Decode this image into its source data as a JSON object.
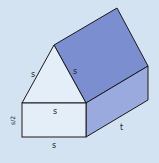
{
  "diagram": {
    "colors": {
      "background": "#d4e3f2",
      "front_face": "#e4eef8",
      "roof_face": "#7b8fd0",
      "side_face": "#9aaade",
      "outline": "#1a1a1a"
    },
    "labels": {
      "roof_left": "s",
      "roof_right": "s",
      "wall_top": "s",
      "wall_bottom": "s",
      "wall_height": "s/2",
      "depth": "t"
    }
  }
}
